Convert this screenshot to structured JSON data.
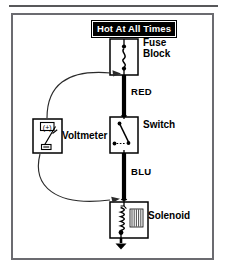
{
  "diagram": {
    "title_banner": "Hot At All Times",
    "components": [
      {
        "id": "fuse-block",
        "label_line1": "Fuse",
        "label_line2": "Block",
        "symbol": "fuse-symbol"
      },
      {
        "id": "switch",
        "label": "Switch",
        "symbol": "switch-symbol"
      },
      {
        "id": "solenoid",
        "label": "Solenoid",
        "symbol": "coil-symbol"
      },
      {
        "id": "voltmeter",
        "label": "Voltmeter",
        "symbol": "meter-symbol",
        "plus_terminal": "(+)",
        "minus_terminal": "(-)"
      }
    ],
    "wires": [
      {
        "id": "wire-red",
        "label": "RED",
        "color": "#000000",
        "from": "fuse-block",
        "to": "switch"
      },
      {
        "id": "wire-blu",
        "label": "BLU",
        "color": "#000000",
        "from": "switch",
        "to": "solenoid"
      }
    ],
    "probe_arrows": [
      {
        "id": "probe-arrow-upper",
        "points_to": "wire-red"
      },
      {
        "id": "probe-arrow-lower",
        "points_to": "wire-blu"
      }
    ],
    "ground": {
      "id": "ground-symbol",
      "present": true
    }
  },
  "colors": {
    "frame": "#6b6b70",
    "rule": "#58585a",
    "ink": "#000000",
    "paper": "#ffffff"
  }
}
